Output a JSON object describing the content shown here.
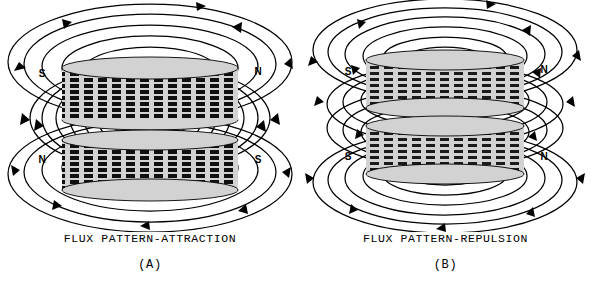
{
  "figure": {
    "background_color": "#ffffff",
    "line_color": "#000000",
    "magnet_fill": "#cfcfcf"
  },
  "panels": [
    {
      "id": "A",
      "label": "(A)",
      "caption": "FLUX PATTERN-ATTRACTION",
      "interaction": "attraction",
      "magnets": [
        {
          "position": "upper",
          "left_pole": "S",
          "right_pole": "N",
          "hatching": "vertical-bars"
        },
        {
          "position": "lower",
          "left_pole": "N",
          "right_pole": "S",
          "hatching": "vertical-bars"
        }
      ],
      "flux": {
        "outer_loops_top": 6,
        "outer_loops_bottom": 6,
        "between_loops": 7,
        "crosses_gap": true,
        "description": "Flux lines pass from the N pole of one magnet directly into the S pole of the other, linking both magnets through the gap."
      }
    },
    {
      "id": "B",
      "label": "(B)",
      "caption": "FLUX PATTERN-REPULSION",
      "interaction": "repulsion",
      "magnets": [
        {
          "position": "upper",
          "left_pole": "S",
          "right_pole": "N",
          "hatching": "vertical-bars"
        },
        {
          "position": "lower",
          "left_pole": "S",
          "right_pole": "N",
          "hatching": "vertical-bars"
        }
      ],
      "flux": {
        "outer_loops_top": 6,
        "outer_loops_bottom": 6,
        "between_loops": 5,
        "crosses_gap": false,
        "description": "Each magnet keeps its own closed flux loops; the lines in the gap oppose each other and do not link, so the magnets repel."
      }
    }
  ]
}
